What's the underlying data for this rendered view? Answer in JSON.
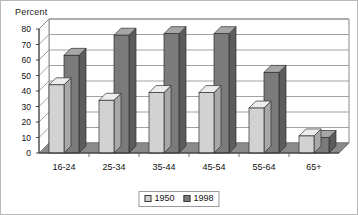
{
  "chart_data": {
    "type": "bar",
    "title": "",
    "subtitle": "",
    "xlabel": "",
    "ylabel": "Percent",
    "categories": [
      "16-24",
      "25-34",
      "35-44",
      "45-54",
      "55-64",
      "65+"
    ],
    "series": [
      {
        "name": "1950",
        "values": [
          44,
          34,
          39,
          39,
          29,
          11
        ],
        "color": "#d2d2d2"
      },
      {
        "name": "1998",
        "values": [
          63,
          76,
          77,
          77,
          52,
          10
        ],
        "color": "#7b7b7b"
      }
    ],
    "ylim": [
      0,
      80
    ],
    "yticks": [
      0,
      10,
      20,
      30,
      40,
      50,
      60,
      70,
      80
    ],
    "ytick_labels": [
      "0",
      "10",
      "20",
      "30",
      "40",
      "50",
      "60",
      "70",
      "80"
    ],
    "grid": true,
    "grid_axis": "y",
    "legend_position": "bottom",
    "style": "3d-bar",
    "colors": {
      "series_1950_face": "#d2d2d2",
      "series_1950_top": "#ededed",
      "series_1950_side": "#a8a8a8",
      "series_1998_face": "#7b7b7b",
      "series_1998_top": "#a6a6a6",
      "series_1998_side": "#5c5c5c",
      "floor": "#8a8a8a",
      "wall": "#ffffff",
      "gridline": "#8a8a8a",
      "frame": "#b9b9b9",
      "text": "#111111"
    }
  },
  "legend": {
    "items": [
      {
        "label": "1950"
      },
      {
        "label": "1998"
      }
    ]
  },
  "axis": {
    "y_title": "Percent"
  }
}
